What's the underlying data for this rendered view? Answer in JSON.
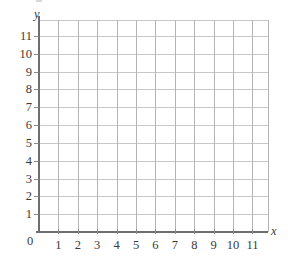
{
  "chart_data": {
    "type": "scatter",
    "title": "",
    "subtitle": "",
    "xlabel": "x",
    "ylabel": "y",
    "xlim": [
      0,
      11.8
    ],
    "ylim": [
      0,
      11.9
    ],
    "grid": true,
    "legend": null,
    "series": [],
    "x": [],
    "values": [],
    "annotations": [],
    "origin_label": "0",
    "xticks": [
      1,
      2,
      3,
      4,
      5,
      6,
      7,
      8,
      9,
      10,
      11
    ],
    "yticks": [
      1,
      2,
      3,
      4,
      5,
      6,
      7,
      8,
      9,
      10,
      11
    ],
    "xtick_labels": [
      "1",
      "2",
      "3",
      "4",
      "5",
      "6",
      "7",
      "8",
      "9",
      "10",
      "11"
    ],
    "ytick_labels": [
      "1",
      "2",
      "3",
      "4",
      "5",
      "6",
      "7",
      "8",
      "9",
      "10",
      "11"
    ],
    "gridlines_x": [
      1,
      2,
      3,
      4,
      5,
      6,
      7,
      8,
      9,
      10,
      11,
      11.8
    ],
    "gridlines_y": [
      1,
      2,
      3,
      4,
      5,
      6,
      7,
      8,
      9,
      10,
      11,
      11.9
    ],
    "colors": {
      "background": "#ffffff",
      "axis": "#6e6e6e",
      "gridline_horizontal": "#c8c8c8",
      "gridline_vertical": "#b4b4b4",
      "tick_mark": "#8a8a8a",
      "text": "#3a3a3a"
    }
  }
}
